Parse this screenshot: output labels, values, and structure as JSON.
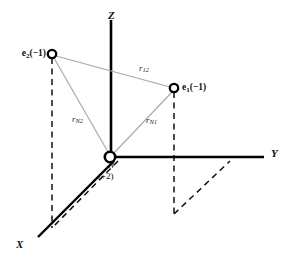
{
  "figure": {
    "background_color": "#ffffff",
    "axis_color": "#000000",
    "ray_color": "#a8a8a8",
    "dashed_color": "#111111",
    "node_fill": "#ffffff",
    "node_stroke": "#000000"
  },
  "axes": [
    {
      "name": "z-axis",
      "label": "Z",
      "label_x": 108,
      "label_y": 10
    },
    {
      "name": "y-axis",
      "label": "Y",
      "label_x": 271,
      "label_y": 148
    },
    {
      "name": "x-axis",
      "label": "X",
      "label_x": 16,
      "label_y": 239
    }
  ],
  "nodes": [
    {
      "name": "electron-2",
      "label_main": "e",
      "label_sub": "2",
      "label_charge": "(−1)",
      "label_x": 40,
      "label_y": 48,
      "cx": 52,
      "cy": 54,
      "r": 4.2
    },
    {
      "name": "electron-1",
      "label_main": "e",
      "label_sub": "1",
      "label_charge": "(−1)",
      "label_x": 184,
      "label_y": 82,
      "cx": 174,
      "cy": 88,
      "r": 4.2
    },
    {
      "name": "nucleus",
      "label_main": "N",
      "label_sub": "",
      "label_charge": "(+2)",
      "label_x": 111,
      "label_y": 163,
      "charge_x": 100,
      "charge_y": 173,
      "cx": 110,
      "cy": 157,
      "r": 5.2
    }
  ],
  "distances": [
    {
      "name": "r12",
      "main": "r",
      "sub": "12",
      "label_x": 139,
      "label_y": 65,
      "from": "electron-2",
      "to": "electron-1"
    },
    {
      "name": "rN2",
      "main": "r",
      "sub": "N2",
      "label_x": 72,
      "label_y": 116,
      "from": "nucleus",
      "to": "electron-2"
    },
    {
      "name": "rN1",
      "main": "r",
      "sub": "N1",
      "label_x": 146,
      "label_y": 117,
      "from": "nucleus",
      "to": "electron-1"
    }
  ]
}
